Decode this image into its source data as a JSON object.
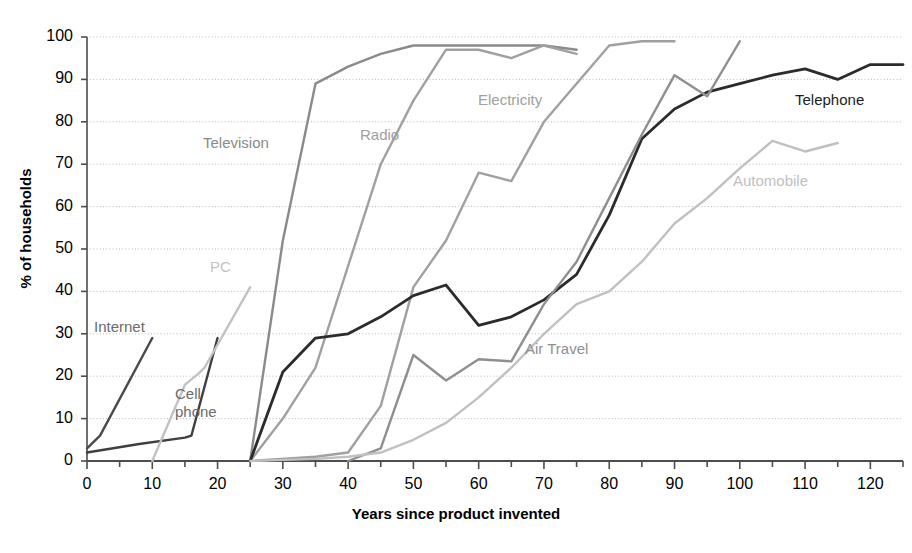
{
  "chart_data": {
    "type": "line",
    "title": "",
    "xlabel": "Years since product invented",
    "ylabel": "% of households",
    "xlim": [
      0,
      125
    ],
    "ylim": [
      0,
      100
    ],
    "xticks": [
      0,
      10,
      20,
      30,
      40,
      50,
      60,
      70,
      80,
      90,
      100,
      110,
      120
    ],
    "xtick_minor_step": 5,
    "yticks": [
      0,
      10,
      20,
      30,
      40,
      50,
      60,
      70,
      80,
      90,
      100
    ],
    "grid": "horizontal-dotted",
    "legend": "inline-labels",
    "series": [
      {
        "name": "Internet",
        "color": "#4a4a4a",
        "width": 2.4,
        "label_x": 94,
        "label_y": 318,
        "points": [
          [
            0,
            3
          ],
          [
            2,
            6
          ],
          [
            10,
            29
          ]
        ]
      },
      {
        "name": "Cell phone",
        "color": "#3f3f3f",
        "width": 2.4,
        "label_x": 175,
        "label_y": 385,
        "points": [
          [
            0,
            2
          ],
          [
            8,
            4
          ],
          [
            15,
            5.5
          ],
          [
            16,
            6
          ],
          [
            20,
            29
          ]
        ]
      },
      {
        "name": "PC",
        "color": "#c2c2c2",
        "width": 2.4,
        "label_x": 210,
        "label_y": 258,
        "points": [
          [
            10,
            0
          ],
          [
            15,
            18
          ],
          [
            17,
            20.5
          ],
          [
            18,
            22
          ],
          [
            25,
            41
          ]
        ]
      },
      {
        "name": "Television",
        "color": "#8a8a8a",
        "width": 2.4,
        "label_x": 203,
        "label_y": 134,
        "points": [
          [
            25,
            0
          ],
          [
            30,
            52
          ],
          [
            35,
            89
          ],
          [
            40,
            93
          ],
          [
            45,
            96
          ],
          [
            50,
            98
          ],
          [
            65,
            98
          ],
          [
            70,
            98
          ],
          [
            75,
            97
          ]
        ]
      },
      {
        "name": "Radio",
        "color": "#a0a0a0",
        "width": 2.4,
        "label_x": 360,
        "label_y": 126,
        "points": [
          [
            25,
            0
          ],
          [
            30,
            10
          ],
          [
            35,
            22
          ],
          [
            40,
            46
          ],
          [
            45,
            70
          ],
          [
            50,
            85
          ],
          [
            55,
            97
          ],
          [
            60,
            97
          ],
          [
            65,
            95
          ],
          [
            70,
            98
          ],
          [
            75,
            96
          ]
        ]
      },
      {
        "name": "Electricity",
        "color": "#a0a0a0",
        "width": 2.4,
        "label_x": 478,
        "label_y": 91,
        "points": [
          [
            25,
            0
          ],
          [
            35,
            1
          ],
          [
            40,
            2
          ],
          [
            45,
            13
          ],
          [
            50,
            41
          ],
          [
            55,
            52
          ],
          [
            60,
            68
          ],
          [
            65,
            66
          ],
          [
            70,
            80
          ],
          [
            80,
            98
          ],
          [
            85,
            99
          ],
          [
            90,
            99
          ]
        ]
      },
      {
        "name": "Telephone",
        "color": "#2b2b2b",
        "width": 2.8,
        "label_x": 795,
        "label_y": 91,
        "points": [
          [
            25,
            0
          ],
          [
            30,
            21
          ],
          [
            35,
            29
          ],
          [
            40,
            30
          ],
          [
            45,
            34
          ],
          [
            50,
            39
          ],
          [
            55,
            41.5
          ],
          [
            60,
            32
          ],
          [
            65,
            34
          ],
          [
            70,
            38
          ],
          [
            75,
            44
          ],
          [
            80,
            58
          ],
          [
            85,
            76
          ],
          [
            90,
            83
          ],
          [
            95,
            87
          ],
          [
            100,
            89
          ],
          [
            105,
            91
          ],
          [
            110,
            92.5
          ],
          [
            115,
            90
          ],
          [
            120,
            93.5
          ],
          [
            125,
            93.5
          ]
        ]
      },
      {
        "name": "Air Travel",
        "color": "#8f8f8f",
        "width": 2.4,
        "label_x": 525,
        "label_y": 340,
        "points": [
          [
            40,
            0
          ],
          [
            45,
            3
          ],
          [
            50,
            25
          ],
          [
            55,
            19
          ],
          [
            60,
            24
          ],
          [
            65,
            23.5
          ],
          [
            70,
            37
          ],
          [
            75,
            47
          ],
          [
            80,
            62
          ],
          [
            85,
            77
          ],
          [
            90,
            91
          ],
          [
            95,
            86
          ],
          [
            100,
            99
          ]
        ]
      },
      {
        "name": "Automobile",
        "color": "#c0c0c0",
        "width": 2.4,
        "label_x": 733,
        "label_y": 172,
        "points": [
          [
            25,
            0
          ],
          [
            35,
            0.5
          ],
          [
            40,
            1
          ],
          [
            45,
            2
          ],
          [
            50,
            5
          ],
          [
            55,
            9
          ],
          [
            60,
            15
          ],
          [
            65,
            22
          ],
          [
            70,
            30
          ],
          [
            75,
            37
          ],
          [
            80,
            40
          ],
          [
            85,
            47
          ],
          [
            90,
            56
          ],
          [
            95,
            62
          ],
          [
            100,
            69
          ],
          [
            105,
            75.5
          ],
          [
            110,
            73
          ],
          [
            115,
            75
          ]
        ]
      }
    ]
  },
  "axes": {
    "x_title": "Years since product invented",
    "y_title": "% of households",
    "x_tick_labels": [
      "0",
      "10",
      "20",
      "30",
      "40",
      "50",
      "60",
      "70",
      "80",
      "90",
      "100",
      "110",
      "120"
    ],
    "y_tick_labels": [
      "0",
      "10",
      "20",
      "30",
      "40",
      "50",
      "60",
      "70",
      "80",
      "90",
      "100"
    ]
  },
  "labels": {
    "internet": "Internet",
    "cell_phone_line1": "Cell",
    "cell_phone_line2": "phone",
    "pc": "PC",
    "television": "Television",
    "radio": "Radio",
    "electricity": "Electricity",
    "telephone": "Telephone",
    "air_travel": "Air Travel",
    "automobile": "Automobile"
  },
  "colors": {
    "background": "#ffffff",
    "axis": "#4d4d4d",
    "grid": "#b9b9b9",
    "text": "#000000"
  }
}
